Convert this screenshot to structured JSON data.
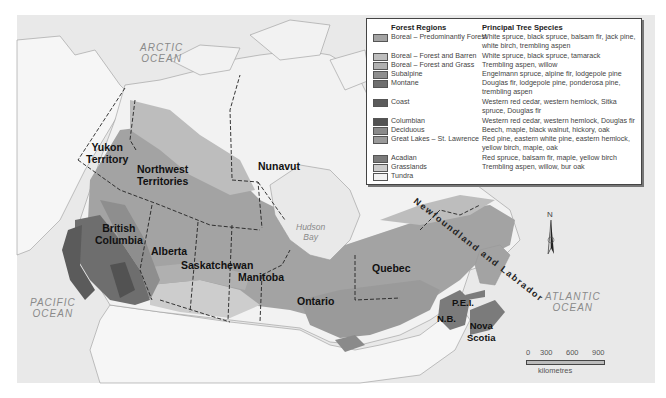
{
  "map": {
    "title": "Forest Regions of Canada",
    "oceans": [
      {
        "name": "ARCTIC OCEAN",
        "line1": "ARCTIC",
        "line2": "OCEAN"
      },
      {
        "name": "PACIFIC OCEAN",
        "line1": "PACIFIC",
        "line2": "OCEAN"
      },
      {
        "name": "ATLANTIC OCEAN",
        "line1": "ATLANTIC",
        "line2": "OCEAN"
      }
    ],
    "bay": {
      "line1": "Hudson",
      "line2": "Bay"
    },
    "provinces": {
      "yukon": {
        "line1": "Yukon",
        "line2": "Territory"
      },
      "nwt": {
        "line1": "Northwest",
        "line2": "Territories"
      },
      "nunavut": "Nunavut",
      "bc": {
        "line1": "British",
        "line2": "Columbia"
      },
      "alberta": "Alberta",
      "saskatchewan": "Saskatchewan",
      "manitoba": "Manitoba",
      "ontario": "Ontario",
      "quebec": "Quebec",
      "nl": "Newfoundland and Labrador",
      "pei": "P.E.I.",
      "nb": "N.B.",
      "ns": {
        "line1": "Nova",
        "line2": "Scotia"
      }
    },
    "north_arrow": "N",
    "scale": {
      "ticks": [
        "0",
        "300",
        "600",
        "900"
      ],
      "unit": "kilometres"
    },
    "colors": {
      "water": "#e9e9e9",
      "land_outside": "#f6f6f6",
      "tundra": "#f2f2f2",
      "boreal_forest": "#a3a3a3",
      "boreal_barren": "#bdbdbd",
      "boreal_grass": "#b0b0b0",
      "subalpine": "#8e8e8e",
      "montane": "#6e6e6e",
      "coast": "#5b5b5b",
      "columbian": "#525252",
      "deciduous": "#8a8a8a",
      "great_lakes": "#9a9a9a",
      "acadian": "#7b7b7b",
      "grasslands": "#cdcdcd"
    }
  },
  "legend": {
    "header_regions": "Forest Regions",
    "header_species": "Principal Tree Species",
    "items": [
      {
        "region": "Boreal – Predominantly Forest",
        "species": "White spruce, black spruce, balsam fir, jack pine, white birch, trembling aspen",
        "color": "#a3a3a3"
      },
      {
        "region": "Boreal – Forest and Barren",
        "species": "White spruce, black spruce, tamarack",
        "color": "#bdbdbd"
      },
      {
        "region": "Boreal – Forest and Grass",
        "species": "Trembling aspen, willow",
        "color": "#b0b0b0"
      },
      {
        "region": "Subalpine",
        "species": "Engelmann spruce, alpine fir, lodgepole pine",
        "color": "#8e8e8e"
      },
      {
        "region": "Montane",
        "species": "Douglas fir, lodgepole pine, ponderosa pine, trembling aspen",
        "color": "#6e6e6e"
      },
      {
        "region": "Coast",
        "species": "Western red cedar, western hemlock, Sitka spruce, Douglas fir",
        "color": "#5b5b5b"
      },
      {
        "region": "Columbian",
        "species": "Western red cedar, western hemlock, Douglas fir",
        "color": "#525252"
      },
      {
        "region": "Deciduous",
        "species": "Beech, maple, black walnut, hickory, oak",
        "color": "#8a8a8a"
      },
      {
        "region": "Great Lakes – St. Lawrence",
        "species": "Red pine, eastern white pine, eastern hemlock, yellow birch, maple, oak",
        "color": "#9a9a9a"
      },
      {
        "region": "Acadian",
        "species": "Red spruce, balsam fir, maple, yellow birch",
        "color": "#7b7b7b"
      },
      {
        "region": "Grasslands",
        "species": "Trembling aspen, willow, bur oak",
        "color": "#cdcdcd"
      },
      {
        "region": "Tundra",
        "species": "",
        "color": "#f2f2f2"
      }
    ]
  }
}
